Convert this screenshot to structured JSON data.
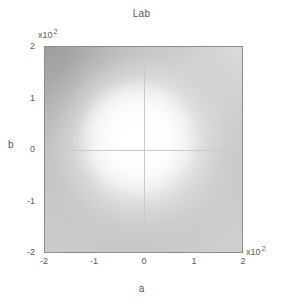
{
  "figure": {
    "title": "Lab",
    "background_color": "#ffffff",
    "contour_color": "#9a9a9a",
    "axis_color": "#8d8d8d"
  },
  "axes": {
    "x": {
      "label": "a",
      "ticks": [
        "-2",
        "-1",
        "0",
        "1",
        "2"
      ],
      "multiplier_base": "x10",
      "multiplier_exponent": "2",
      "range": [
        -2,
        2
      ]
    },
    "y": {
      "label": "b",
      "ticks": [
        "2",
        "1",
        "0",
        "-1",
        "-2"
      ],
      "multiplier_base": "x10",
      "multiplier_exponent": "2",
      "range": [
        -2,
        2
      ]
    }
  },
  "chart_data": {
    "type": "contour",
    "title": "Lab",
    "xlabel": "a",
    "ylabel": "b",
    "xlim": [
      -2,
      2
    ],
    "ylim": [
      -2,
      2
    ],
    "x_tick_values": [
      -2,
      -1,
      0,
      1,
      2
    ],
    "y_tick_values": [
      -2,
      -1,
      0,
      1,
      2
    ],
    "x_scale_multiplier": 100,
    "y_scale_multiplier": 100,
    "grid": false,
    "legend": "none",
    "zero_crosshairs": true,
    "background_field": {
      "description": "grayscale luminance field, bright near origin, darkening outward, darkest toward upper-left",
      "corner_values": {
        "upper_left": "#b0b0b0",
        "upper_right": "#d4d4d4",
        "lower_left": "#c8c8c8",
        "lower_right": "#cccccc",
        "center": "#fdfdfd"
      }
    },
    "contours": [
      {
        "name": "gamut-boundary",
        "closed": true,
        "color": "#9a9a9a",
        "vertices": [
          [
            0.02,
            1.05
          ],
          [
            -0.38,
            0.72
          ],
          [
            -0.63,
            0.42
          ],
          [
            -0.75,
            0.17
          ],
          [
            -0.72,
            -0.08
          ],
          [
            -0.55,
            -0.38
          ],
          [
            -0.33,
            -0.6
          ],
          [
            -0.2,
            -0.68
          ],
          [
            0.3,
            -0.69
          ],
          [
            0.47,
            -0.62
          ],
          [
            0.7,
            -0.32
          ],
          [
            0.78,
            -0.05
          ],
          [
            0.79,
            0.22
          ],
          [
            0.72,
            0.4
          ],
          [
            0.52,
            0.63
          ],
          [
            0.26,
            0.86
          ],
          [
            0.02,
            1.05
          ]
        ]
      }
    ]
  }
}
